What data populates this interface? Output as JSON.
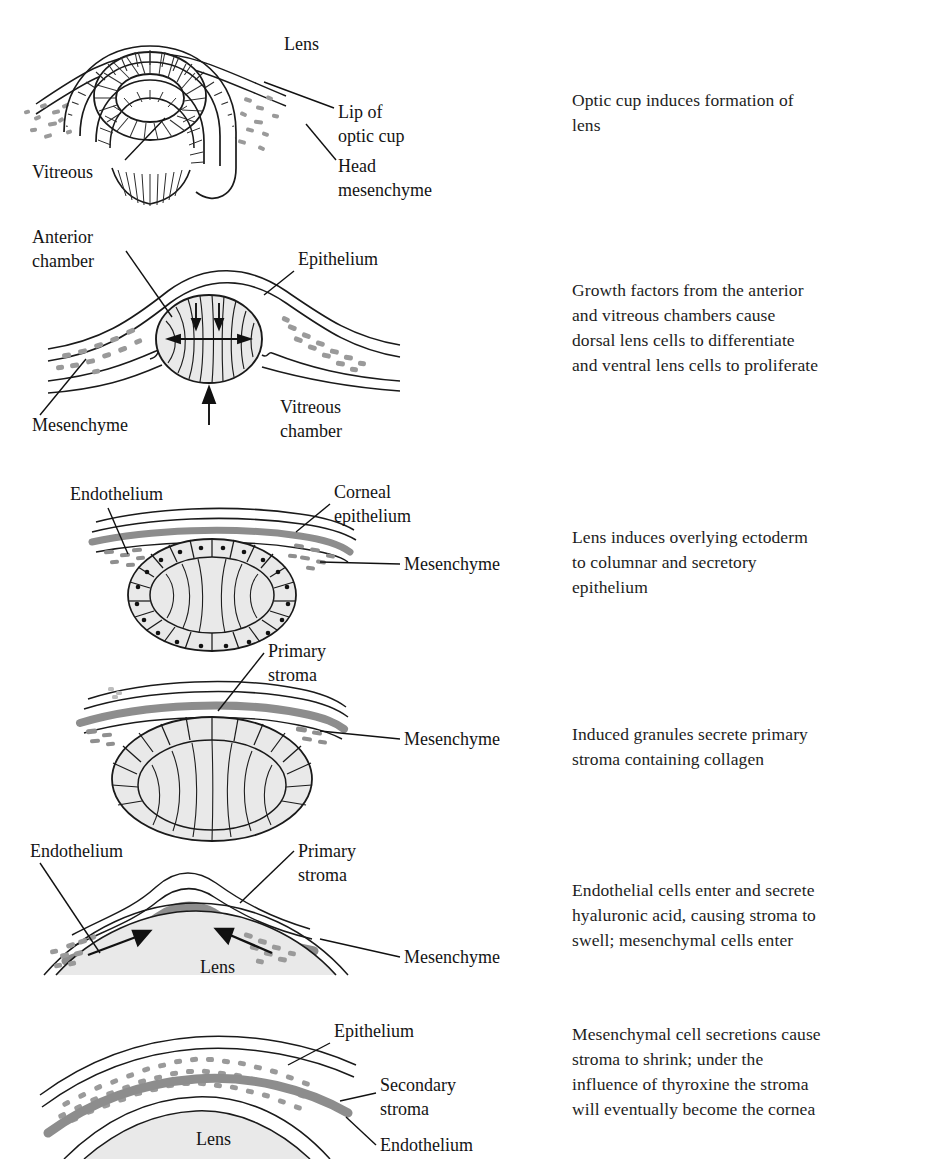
{
  "figure": {
    "colors": {
      "ink": "#141414",
      "stroma_gray": "#8d8d8d",
      "mesenchyme_gray": "#9a9a9a",
      "lens_fill": "#e9e9e9",
      "page": "#ffffff"
    }
  },
  "panels": [
    {
      "id": "panel-1-optic-cup",
      "labels": {
        "lens": "Lens",
        "lip_of_optic_cup": "Lip of\noptic cup",
        "lip_of_optic_cup_line1": "Lip of",
        "lip_of_optic_cup_line2": "optic cup",
        "vitreous": "Vitreous",
        "head_mesenchyme_line1": "Head",
        "head_mesenchyme_line2": "mesenchyme"
      },
      "caption_lines": [
        "Optic cup induces formation of",
        "lens"
      ]
    },
    {
      "id": "panel-2-lens-vesicle",
      "labels": {
        "anterior_chamber_line1": "Anterior",
        "anterior_chamber_line2": "chamber",
        "epithelium": "Epithelium",
        "mesenchyme": "Mesenchyme",
        "vitreous_chamber_line1": "Vitreous",
        "vitreous_chamber_line2": "chamber"
      },
      "caption_lines": [
        "Growth factors from the anterior",
        "and vitreous chambers cause",
        "dorsal lens cells to differentiate",
        "and ventral lens cells to proliferate"
      ]
    },
    {
      "id": "panel-3-columnar-epithelium",
      "labels": {
        "endothelium": "Endothelium",
        "corneal_epithelium_line1": "Corneal",
        "corneal_epithelium_line2": "epithelium",
        "mesenchyme": "Mesenchyme"
      },
      "caption_lines": [
        "Lens induces overlying ectoderm",
        "to columnar and secretory",
        "epithelium"
      ]
    },
    {
      "id": "panel-4-primary-stroma",
      "labels": {
        "primary_stroma_line1": "Primary",
        "primary_stroma_line2": "stroma",
        "mesenchyme": "Mesenchyme"
      },
      "caption_lines": [
        "Induced granules secrete primary",
        "stroma containing collagen"
      ]
    },
    {
      "id": "panel-5-stroma-swell",
      "labels": {
        "endothelium": "Endothelium",
        "primary_stroma_line1": "Primary",
        "primary_stroma_line2": "stroma",
        "lens": "Lens",
        "mesenchyme": "Mesenchyme"
      },
      "caption_lines": [
        "Endothelial cells enter and secrete",
        "hyaluronic acid, causing stroma to",
        "swell; mesenchymal cells enter"
      ]
    },
    {
      "id": "panel-6-secondary-stroma",
      "labels": {
        "epithelium": "Epithelium",
        "secondary_stroma_line1": "Secondary",
        "secondary_stroma_line2": "stroma",
        "endothelium": "Endothelium",
        "lens": "Lens"
      },
      "caption_lines": [
        "Mesenchymal cell secretions cause",
        "stroma to shrink; under the",
        "influence of thyroxine the stroma",
        "will eventually become the cornea"
      ]
    }
  ]
}
